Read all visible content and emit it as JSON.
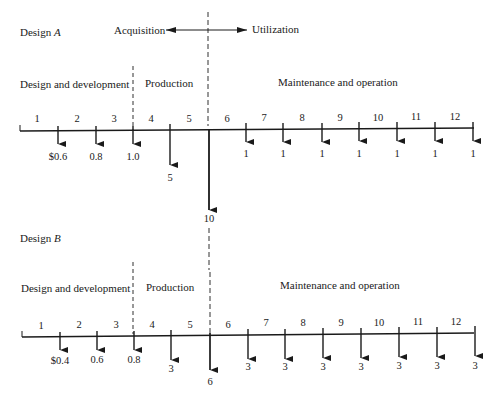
{
  "diagram": {
    "phase_arrow": {
      "left_label": "Acquisition",
      "right_label": "Utilization"
    },
    "designs": [
      {
        "title_prefix": "Design ",
        "title_letter": "A",
        "phases": [
          "Design and development",
          "Production",
          "Maintenance and operation"
        ],
        "periods": [
          "1",
          "2",
          "3",
          "4",
          "5",
          "6",
          "7",
          "8",
          "9",
          "10",
          "11",
          "12"
        ],
        "cash_flows": [
          "$0.6",
          "0.8",
          "1.0",
          "5",
          "10",
          "1",
          "1",
          "1",
          "1",
          "1",
          "1",
          "1"
        ]
      },
      {
        "title_prefix": "Design ",
        "title_letter": "B",
        "phases": [
          "Design and development",
          "Production",
          "Maintenance and operation"
        ],
        "periods": [
          "1",
          "2",
          "3",
          "4",
          "5",
          "6",
          "7",
          "8",
          "9",
          "10",
          "11",
          "12"
        ],
        "cash_flows": [
          "$0.4",
          "0.6",
          "0.8",
          "3",
          "6",
          "3",
          "3",
          "3",
          "3",
          "3",
          "3",
          "3"
        ]
      }
    ]
  }
}
